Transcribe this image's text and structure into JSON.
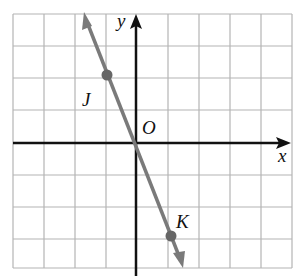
{
  "graph": {
    "grid": {
      "x_min": -4,
      "x_max": 5,
      "y_min": -4,
      "y_max": 4,
      "cell_px": 31.5
    },
    "axes": {
      "x_label": "x",
      "y_label": "y",
      "origin_label": "O"
    },
    "line": {
      "color": "#7a7a7a",
      "through": [
        "J",
        "O",
        "K"
      ]
    },
    "points": [
      {
        "name": "J",
        "x": -1,
        "y": 2
      },
      {
        "name": "K",
        "x": 1,
        "y": -3
      }
    ],
    "colors": {
      "grid": "#b0b0b0",
      "axis": "#111111",
      "line": "#7a7a7a",
      "point": "#666666"
    }
  }
}
